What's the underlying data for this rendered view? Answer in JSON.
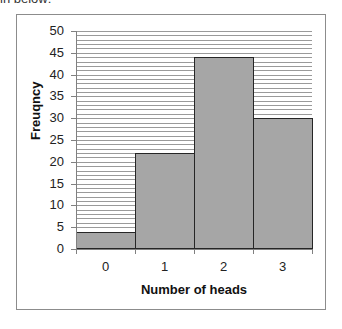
{
  "context": {
    "cropped_text_fragment": "in below:"
  },
  "chart_data": {
    "type": "bar",
    "title": "",
    "categories": [
      "0",
      "1",
      "2",
      "3"
    ],
    "values": [
      4,
      22,
      44,
      30
    ],
    "xlabel": "Number of heads",
    "ylabel": "Freuqncy",
    "ylim": [
      0,
      50
    ],
    "yticks": [
      "0",
      "5",
      "10",
      "15",
      "20",
      "25",
      "30",
      "35",
      "40",
      "45",
      "50"
    ],
    "grid": true,
    "grid_interval": 1,
    "legend": null,
    "bar_gap": 0,
    "colors": {
      "bar_fill": "#a6a6a6",
      "bar_outline": "#262626",
      "grid": "#9a9a9a",
      "frame": "#8c8c8c"
    }
  }
}
